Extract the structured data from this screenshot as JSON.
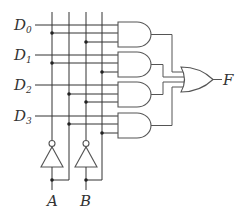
{
  "diagram": {
    "data_inputs": [
      {
        "label": "D",
        "subscript": "0"
      },
      {
        "label": "D",
        "subscript": "1"
      },
      {
        "label": "D",
        "subscript": "2"
      },
      {
        "label": "D",
        "subscript": "3"
      }
    ],
    "select_inputs": [
      "A",
      "B"
    ],
    "output": "F",
    "gates": {
      "and_gates": 4,
      "or_gates": 1,
      "not_gates": 2
    },
    "colors": {
      "wire": "#333333",
      "gate": "#555555",
      "text": "#333333",
      "background": "#ffffff"
    }
  }
}
